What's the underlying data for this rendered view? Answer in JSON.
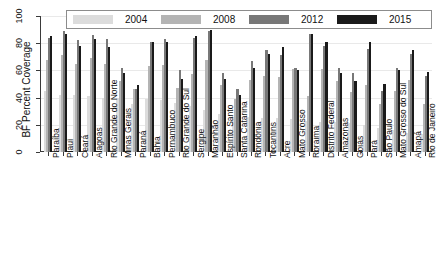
{
  "chart_data": {
    "type": "bar",
    "title": "",
    "xlabel": "",
    "ylabel": "BF Percent Coverage",
    "ylim": [
      0,
      100
    ],
    "yticks": [
      0,
      20,
      40,
      60,
      80,
      100
    ],
    "grid": true,
    "legend_position": "top",
    "legend_entries": [
      "2004",
      "2008",
      "2012",
      "2015"
    ],
    "series_colors": [
      "#dcdcdc",
      "#b4b4b4",
      "#787878",
      "#1a1a1a"
    ],
    "categories": [
      "Paraíba",
      "Piauí",
      "Ceará",
      "Alagoas",
      "Rio Grande do Norte",
      "Minas Gerais",
      "Paraná",
      "Bahia",
      "Pernambuco",
      "Rio Grande do Sul",
      "Sergipe",
      "Maranhão",
      "Espírito Santo",
      "Santa Catarina",
      "Rondônia",
      "Tocantins",
      "Acre",
      "Mato Grosso",
      "Roraima",
      "Distrito Federal",
      "Amazonas",
      "Goiás",
      "Pará",
      "São Paulo",
      "Mato Grosso do Sul",
      "Amapá",
      "Rio de Janeiro"
    ],
    "series": [
      {
        "name": "2004",
        "values": [
          45,
          42,
          42,
          41,
          40,
          40,
          35,
          39,
          38,
          36,
          34,
          31,
          28,
          26,
          26,
          25,
          25,
          24,
          23,
          22,
          22,
          21,
          20,
          18,
          16,
          14,
          13
        ]
      },
      {
        "name": "2008",
        "values": [
          68,
          71,
          65,
          69,
          65,
          52,
          46,
          63,
          64,
          47,
          57,
          68,
          49,
          39,
          53,
          56,
          55,
          61,
          41,
          61,
          52,
          44,
          49,
          35,
          45,
          53,
          35
        ]
      },
      {
        "name": "2012",
        "values": [
          84,
          89,
          82,
          86,
          83,
          62,
          46,
          81,
          83,
          60,
          84,
          89,
          58,
          46,
          67,
          75,
          71,
          62,
          87,
          78,
          62,
          58,
          76,
          45,
          62,
          72,
          56
        ]
      },
      {
        "name": "2015",
        "values": [
          85,
          87,
          78,
          83,
          77,
          58,
          49,
          81,
          81,
          54,
          85,
          90,
          54,
          42,
          62,
          72,
          77,
          60,
          87,
          81,
          58,
          52,
          81,
          50,
          60,
          75,
          59
        ]
      }
    ]
  },
  "axis": {
    "y_title": "BF Percent Coverage",
    "y_tick_labels": [
      "0",
      "20",
      "40",
      "60",
      "80",
      "100"
    ]
  }
}
